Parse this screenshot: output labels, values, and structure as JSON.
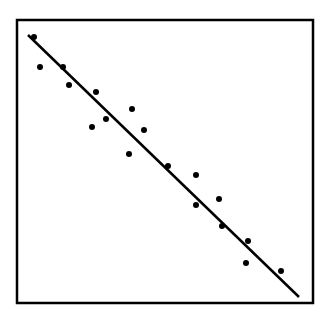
{
  "chart_data": {
    "type": "scatter",
    "title": "",
    "xlabel": "",
    "ylabel": "",
    "grid": false,
    "legend": null,
    "frame": {
      "x0": 17,
      "y0": 20,
      "x1": 313,
      "y1": 303
    },
    "points_px": [
      [
        34,
        37
      ],
      [
        40,
        67
      ],
      [
        63,
        67
      ],
      [
        69,
        85
      ],
      [
        96,
        92
      ],
      [
        92,
        127
      ],
      [
        106,
        119
      ],
      [
        132,
        109
      ],
      [
        144,
        130
      ],
      [
        129,
        154
      ],
      [
        168,
        166
      ],
      [
        196,
        175
      ],
      [
        196,
        205
      ],
      [
        219,
        199
      ],
      [
        222,
        226
      ],
      [
        248,
        241
      ],
      [
        246,
        263
      ],
      [
        281,
        271
      ]
    ],
    "trend_line_px": {
      "x1": 28,
      "y1": 35,
      "x2": 299,
      "y2": 297
    },
    "x": [
      0.06,
      0.08,
      0.16,
      0.18,
      0.27,
      0.25,
      0.3,
      0.39,
      0.43,
      0.38,
      0.51,
      0.6,
      0.6,
      0.68,
      0.69,
      0.78,
      0.77,
      0.89
    ],
    "y": [
      0.94,
      0.83,
      0.83,
      0.77,
      0.74,
      0.62,
      0.65,
      0.68,
      0.61,
      0.52,
      0.48,
      0.45,
      0.35,
      0.37,
      0.27,
      0.22,
      0.14,
      0.11
    ],
    "trend": {
      "type": "linear",
      "slope": -0.95,
      "direction": "negative"
    },
    "colors": {
      "points": "#000000",
      "line": "#000000",
      "frame": "#000000",
      "background": "#ffffff"
    }
  }
}
